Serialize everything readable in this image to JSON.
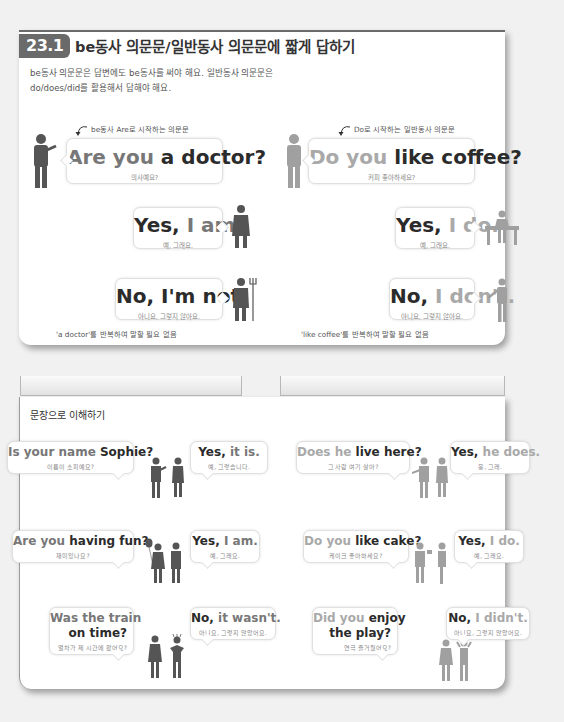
{
  "section": {
    "number": "23.1",
    "title": "be동사 의문문/일반동사 의문문에 짧게 답하기",
    "intro_line1": "be동사 의문문은 답변에도 be동사를 써야 해요. 일반동사 의문문은",
    "intro_line2": "do/does/did를 활용해서 답해야 해요."
  },
  "left_example": {
    "note_top": "be동사 Are로 시작하는 의문문",
    "question": {
      "part1": "Are you ",
      "part2": "a doctor?",
      "ko": "의사예요?"
    },
    "yes": {
      "part1": "Yes, ",
      "part2": "I am.",
      "ko": "예, 그래요."
    },
    "no": {
      "part1": "No, ",
      "part2": "I'm not.",
      "ko": "아니요, 그렇지 않아요."
    },
    "note_bottom": "'a doctor'를 반복하여 말할 필요 없음"
  },
  "right_example": {
    "note_top": "Do로 시작하는 일반동사 의문문",
    "question": {
      "part1": "Do you ",
      "part2": "like coffee?",
      "ko": "커피 좋아하세요?"
    },
    "yes": {
      "part1": "Yes, ",
      "part2": "I do.",
      "ko": "예, 그래요."
    },
    "no": {
      "part1": "No, ",
      "part2": "I don't.",
      "ko": "아니요, 그렇지 않아요."
    },
    "note_bottom": "'like coffee'를 반복하여 말할 필요 없음"
  },
  "practice": {
    "title": "문장으로 이해하기",
    "items": [
      {
        "q1": "Is your name ",
        "q2": "Sophie?",
        "q_ko": "이름이 소피예요?",
        "a1": "Yes, ",
        "a2": "it is.",
        "a_ko": "예, 그렇습니다."
      },
      {
        "q1": "Does he ",
        "q2": "live here?",
        "q_ko": "그 사람 여기 살아?",
        "a1": "Yes, ",
        "a2": "he does.",
        "a_ko": "응, 그래."
      },
      {
        "q1": "Are you ",
        "q2": "having fun?",
        "q_ko": "재미있나요?",
        "a1": "Yes, ",
        "a2": "I am.",
        "a_ko": "예, 그래요."
      },
      {
        "q1": "Do you ",
        "q2": "like cake?",
        "q_ko": "케이크 좋아하세요?",
        "a1": "Yes, ",
        "a2": "I do.",
        "a_ko": "예, 그래요."
      },
      {
        "q1": "Was the train",
        "q2": "on time?",
        "q_ko": "열차가 제 시간에 왔어요?",
        "a1": "No, ",
        "a2": "it wasn't.",
        "a_ko": "아니요, 그렇지 않았어요."
      },
      {
        "q1": "Did you ",
        "q1b": "enjoy",
        "q2": "the play?",
        "q_ko": "연극 즐거웠어요?",
        "a1": "No, ",
        "a2": "I didn't.",
        "a_ko": "아니요, 그렇지 않았어요."
      }
    ]
  },
  "colors": {
    "badge": "#6a6a6a",
    "figure_dark": "#555555",
    "figure_light": "#a0a0a0",
    "background": "#f1f1f1"
  }
}
